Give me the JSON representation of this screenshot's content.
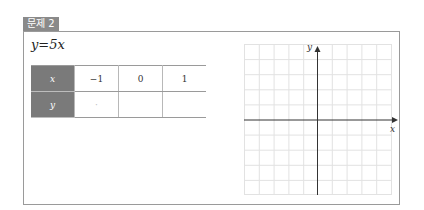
{
  "problem": {
    "label": "문제 2",
    "equation": {
      "lhs": "y",
      "op": "=",
      "rhs": "5x"
    }
  },
  "table": {
    "row_x": {
      "header": "x",
      "cells": [
        "−1",
        "0",
        "1"
      ]
    },
    "row_y": {
      "header": "y",
      "cells": [
        "·",
        "",
        ""
      ]
    }
  },
  "graph": {
    "x_label": "x",
    "y_label": "y",
    "grid_columns": 10,
    "grid_rows": 10,
    "grid_color": "#e2e2e2",
    "axis_color": "#333333"
  },
  "colors": {
    "label_bg": "#8a8a8a",
    "header_bg": "#7a7a7a",
    "border": "#9a9a9a"
  }
}
